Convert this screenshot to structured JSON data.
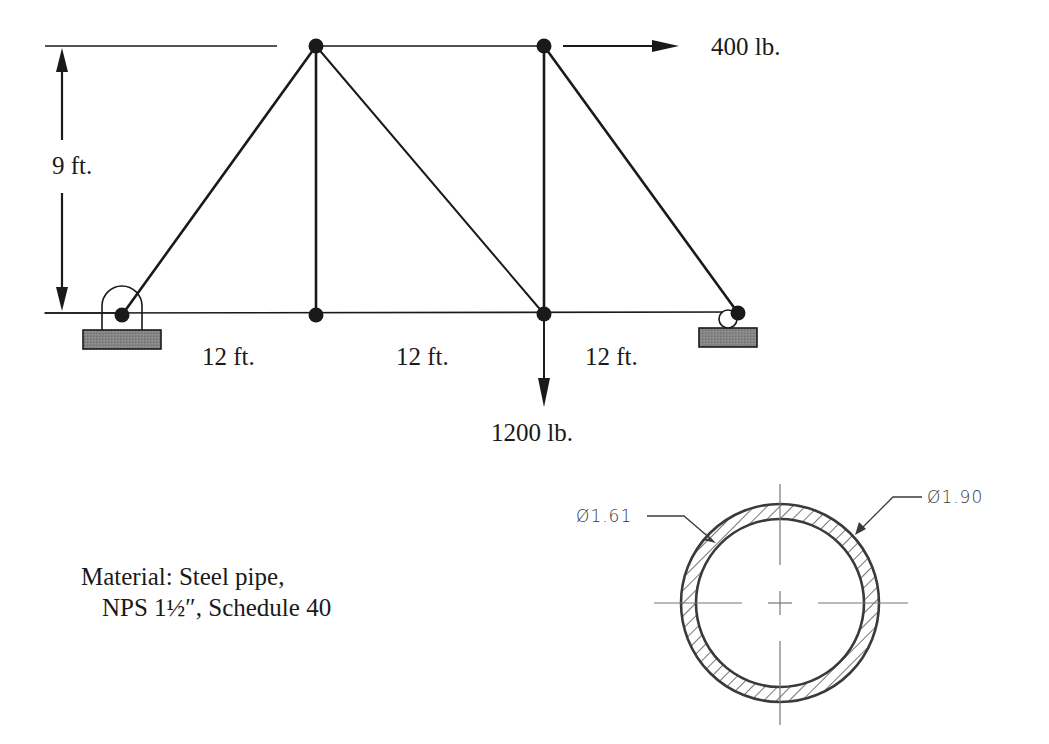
{
  "diagram": {
    "type": "truss",
    "title": "",
    "dimensions": {
      "height_label": "9 ft.",
      "span_labels": [
        "12 ft.",
        "12 ft.",
        "12 ft."
      ]
    },
    "loads": {
      "horizontal": {
        "label": "400 lb.",
        "direction": "right",
        "at_node": "top-right"
      },
      "vertical": {
        "label": "1200 lb.",
        "direction": "down",
        "at_node": "bottom-mid-right"
      }
    },
    "supports": {
      "left": "pin",
      "right": "roller"
    },
    "nodes": [
      {
        "id": "A",
        "pos": "bottom-left",
        "x": 122,
        "y": 315
      },
      {
        "id": "B",
        "pos": "bottom-mid-left",
        "x": 316,
        "y": 315
      },
      {
        "id": "C",
        "pos": "bottom-mid-right",
        "x": 544,
        "y": 314
      },
      {
        "id": "D",
        "pos": "bottom-right",
        "x": 738,
        "y": 313
      },
      {
        "id": "E",
        "pos": "top-left",
        "x": 316,
        "y": 46
      },
      {
        "id": "F",
        "pos": "top-right",
        "x": 544,
        "y": 46
      }
    ],
    "members": [
      [
        "A",
        "B"
      ],
      [
        "B",
        "C"
      ],
      [
        "C",
        "D"
      ],
      [
        "E",
        "F"
      ],
      [
        "A",
        "E"
      ],
      [
        "B",
        "E"
      ],
      [
        "E",
        "C"
      ],
      [
        "C",
        "F"
      ],
      [
        "F",
        "D"
      ]
    ],
    "material": {
      "line1": "Material: Steel pipe,",
      "line2": "NPS 1½″, Schedule 40"
    },
    "section": {
      "inner_diameter_label": "Ø1.61",
      "outer_diameter_label": "Ø1.90"
    },
    "colors": {
      "line": "#1a1a1a",
      "support_fill": "#7a7a7a",
      "section_line": "#3a3a3a",
      "centerline": "#777777"
    }
  }
}
